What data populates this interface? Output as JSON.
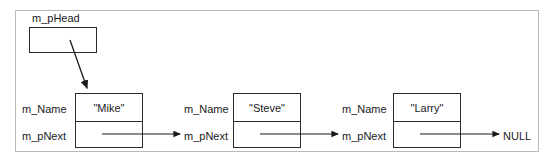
{
  "diagram": {
    "head": {
      "label": "m_pHead",
      "value": ""
    },
    "field_labels": {
      "name": "m_Name",
      "next": "m_pNext"
    },
    "terminator": "NULL",
    "nodes": [
      {
        "name_label": "m_Name",
        "name_value": "\"Mike\"",
        "next_label": "m_pNext"
      },
      {
        "name_label": "m_Name",
        "name_value": "\"Steve\"",
        "next_label": "m_pNext"
      },
      {
        "name_label": "m_Name",
        "name_value": "\"Larry\"",
        "next_label": "m_pNext"
      }
    ],
    "colors": {
      "frame": "#b9b9b9",
      "box_border": "#2b2b2b",
      "arrow": "#1a1a1a",
      "text": "#1a1a1a",
      "background": "#ffffff"
    }
  }
}
